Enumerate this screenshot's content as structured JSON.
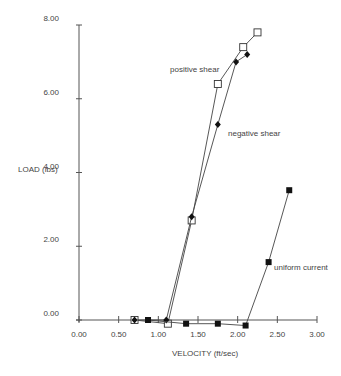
{
  "chart_data": {
    "type": "line",
    "title": "",
    "xlabel": "VELOCITY (ft/sec)",
    "ylabel": "LOAD (lbs)",
    "xlim": [
      0,
      3
    ],
    "ylim": [
      0,
      8
    ],
    "xticks": [
      "0.00",
      "0.50",
      "1.00",
      "1.50",
      "2.00",
      "2.50",
      "3.00"
    ],
    "yticks": [
      "0.00",
      "2.00",
      "4.00",
      "6.00",
      "8.00"
    ],
    "grid": false,
    "legend": "inline annotations",
    "series": [
      {
        "name": "positive shear",
        "marker": "open-square",
        "x": [
          0.7,
          1.12,
          1.42,
          1.75,
          2.07,
          2.25
        ],
        "y": [
          0.0,
          -0.1,
          2.7,
          6.4,
          7.4,
          7.8
        ]
      },
      {
        "name": "negative shear",
        "marker": "filled-diamond",
        "x": [
          0.7,
          1.1,
          1.42,
          1.75,
          1.98,
          2.12
        ],
        "y": [
          0.0,
          0.0,
          2.8,
          5.3,
          7.0,
          7.2
        ]
      },
      {
        "name": "uniform current",
        "marker": "filled-square",
        "x": [
          0.87,
          1.35,
          1.75,
          2.1,
          2.39,
          2.65
        ],
        "y": [
          0.0,
          -0.1,
          -0.1,
          -0.15,
          1.57,
          3.52
        ]
      }
    ],
    "annotations": [
      {
        "text": "positive shear",
        "x_px": 170,
        "y_px": 72
      },
      {
        "text": "negative shear",
        "x_px": 228,
        "y_px": 136
      },
      {
        "text": "uniform current",
        "x_px": 274,
        "y_px": 270
      }
    ]
  }
}
